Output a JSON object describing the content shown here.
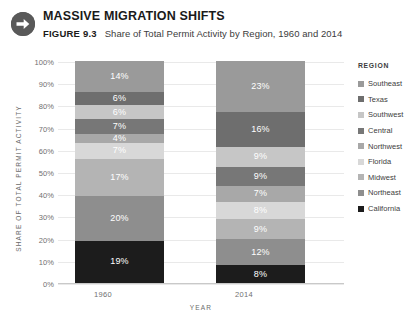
{
  "header": {
    "icon": "arrow-right-circle-icon",
    "title": "MASSIVE MIGRATION SHIFTS",
    "figure_label": "FIGURE 9.3",
    "caption": "Share of Total Permit Activity by Region, 1960 and 2014"
  },
  "legend": {
    "title": "REGION",
    "items": [
      {
        "label": "Southeast",
        "color": "#9a9a9a"
      },
      {
        "label": "Texas",
        "color": "#6e6e6e"
      },
      {
        "label": "Southwest",
        "color": "#c6c6c6"
      },
      {
        "label": "Central",
        "color": "#777777"
      },
      {
        "label": "Northwest",
        "color": "#a8a8a8"
      },
      {
        "label": "Florida",
        "color": "#d8d8d8"
      },
      {
        "label": "Midwest",
        "color": "#b4b4b4"
      },
      {
        "label": "Northeast",
        "color": "#8e8e8e"
      },
      {
        "label": "California",
        "color": "#1c1c1c"
      }
    ]
  },
  "axes": {
    "y_title": "SHARE OF TOTAL PERMIT ACTIVITY",
    "y_ticks": [
      "100%",
      "90%",
      "80%",
      "70%",
      "60%",
      "50%",
      "40%",
      "30%",
      "20%",
      "10%",
      "0%"
    ],
    "x_title": "YEAR",
    "x_ticks": [
      "1960",
      "2014"
    ]
  },
  "chart_data": {
    "type": "bar",
    "subtype": "stacked-100-percent",
    "title": "MASSIVE MIGRATION SHIFTS",
    "subtitle": "FIGURE 9.3  Share of Total Permit Activity by Region, 1960 and 2014",
    "xlabel": "YEAR",
    "ylabel": "SHARE OF TOTAL PERMIT ACTIVITY",
    "ylim": [
      0,
      100
    ],
    "yticks": [
      0,
      10,
      20,
      30,
      40,
      50,
      60,
      70,
      80,
      90,
      100
    ],
    "ytick_labels": [
      "0%",
      "10%",
      "20%",
      "30%",
      "40%",
      "50%",
      "60%",
      "70%",
      "80%",
      "90%",
      "100%"
    ],
    "grid": true,
    "legend_position": "right",
    "legend_title": "REGION",
    "categories": [
      "1960",
      "2014"
    ],
    "stack_order_top_to_bottom": [
      "Southeast",
      "Texas",
      "Southwest",
      "Central",
      "Northwest",
      "Florida",
      "Midwest",
      "Northeast",
      "California"
    ],
    "series": [
      {
        "name": "Southeast",
        "color": "#9a9a9a",
        "values": [
          14,
          23
        ],
        "labels": [
          "14%",
          "23%"
        ]
      },
      {
        "name": "Texas",
        "color": "#6e6e6e",
        "values": [
          6,
          16
        ],
        "labels": [
          "6%",
          "16%"
        ]
      },
      {
        "name": "Southwest",
        "color": "#c6c6c6",
        "values": [
          6,
          9
        ],
        "labels": [
          "6%",
          "9%"
        ]
      },
      {
        "name": "Central",
        "color": "#777777",
        "values": [
          7,
          9
        ],
        "labels": [
          "7%",
          "9%"
        ]
      },
      {
        "name": "Northwest",
        "color": "#a8a8a8",
        "values": [
          4,
          7
        ],
        "labels": [
          "4%",
          "7%"
        ]
      },
      {
        "name": "Florida",
        "color": "#d8d8d8",
        "values": [
          7,
          8
        ],
        "labels": [
          "7%",
          "8%"
        ]
      },
      {
        "name": "Midwest",
        "color": "#b4b4b4",
        "values": [
          17,
          9
        ],
        "labels": [
          "17%",
          "9%"
        ]
      },
      {
        "name": "Northeast",
        "color": "#8e8e8e",
        "values": [
          20,
          12
        ],
        "labels": [
          "20%",
          "12%"
        ]
      },
      {
        "name": "California",
        "color": "#1c1c1c",
        "values": [
          19,
          8
        ],
        "labels": [
          "19%",
          "8%"
        ]
      }
    ]
  }
}
